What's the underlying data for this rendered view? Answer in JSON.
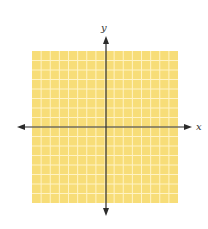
{
  "diagram": {
    "type": "coordinate-plane",
    "x_axis_label": "x",
    "y_axis_label": "y",
    "grid": {
      "cells_x": 16,
      "cells_y": 16,
      "left": 32,
      "top": 51,
      "right": 178,
      "bottom": 203
    },
    "origin": {
      "x": 106,
      "y": 127
    },
    "colors": {
      "grid_fill": "#F7DD78",
      "grid_lines": "#FFF3C4",
      "axis": "#2b2b2b",
      "label": "#333333"
    }
  }
}
